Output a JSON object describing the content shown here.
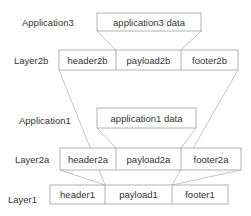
{
  "diagram": {
    "layers": {
      "application3": {
        "label": "Application3",
        "cells": [
          "application3 data"
        ]
      },
      "layer2b": {
        "label": "Layer2b",
        "cells": [
          "header2b",
          "payload2b",
          "footer2b"
        ]
      },
      "application1": {
        "label": "Application1",
        "cells": [
          "application1 data"
        ]
      },
      "layer2a": {
        "label": "Layer2a",
        "cells": [
          "header2a",
          "payload2a",
          "footer2a"
        ]
      },
      "layer1": {
        "label": "Layer1",
        "cells": [
          "header1",
          "payload1",
          "footer1"
        ]
      }
    },
    "connections": [
      {
        "from": "application3 data",
        "to": "payload2b"
      },
      {
        "from": "layer2b",
        "to": "payload1"
      },
      {
        "from": "application1 data",
        "to": "payload2a"
      },
      {
        "from": "layer2a",
        "to": "payload1"
      }
    ],
    "colors": {
      "text": "#333333",
      "box_stroke": "#a8a8a8",
      "connector": "#b4b4b4",
      "background": "#ffffff"
    }
  }
}
